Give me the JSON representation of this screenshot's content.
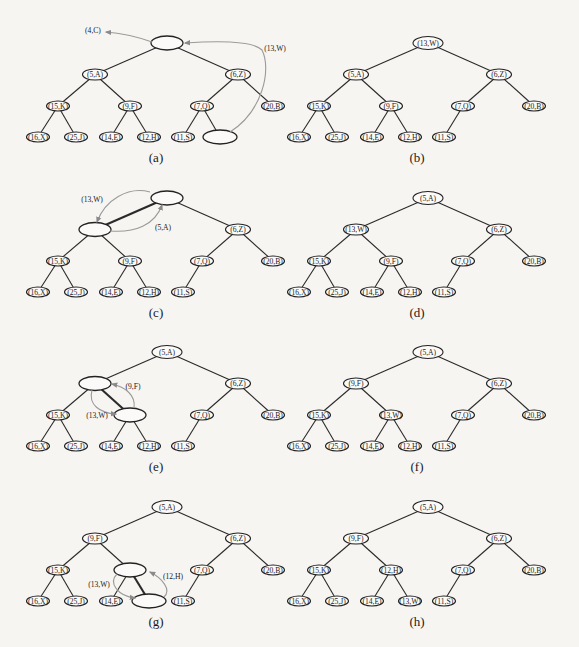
{
  "figure": {
    "background": "#f7f5f2",
    "arrow_color": "#9a9a9a",
    "panels": [
      {
        "id": "a",
        "label": "(a)",
        "col": 0,
        "row": 0,
        "nodes": {
          "root": "",
          "L": "(5,A)",
          "R": "(6,Z)",
          "LL": "(15,K)",
          "LR": "(9,F)",
          "RL": "(7,Q)",
          "RR": "(20,B)",
          "LLL": "(16,X)",
          "LLR": "(25,J)",
          "LRL": "(14,E)",
          "LRR": "(12,H)",
          "RLL": "(11,S)",
          "RLR": ""
        },
        "thick_edges": [],
        "annotations": [
          {
            "text": "(4,C)",
            "x": 93,
            "y": 30
          },
          {
            "text": "(13,W)",
            "x": 275,
            "y": 48
          }
        ],
        "arrows": [
          {
            "d": "M152,42 C135,36 120,33 106,32",
            "head": [
              106,
              32
            ]
          },
          {
            "d": "M230,132 C262,112 272,70 262,50 C252,40 215,41 185,43",
            "head": [
              185,
              43
            ]
          }
        ]
      },
      {
        "id": "b",
        "label": "(b)",
        "col": 1,
        "row": 0,
        "nodes": {
          "root": "(13,W)",
          "L": "(5,A)",
          "R": "(6,Z)",
          "LL": "(15,K)",
          "LR": "(9,F)",
          "RL": "(7,Q)",
          "RR": "(20,B)",
          "LLL": "(16,X)",
          "LLR": "(25,J)",
          "LRL": "(14,E)",
          "LRR": "(12,H)",
          "RLL": "(11,S)",
          "RLR": null
        },
        "thick_edges": [],
        "annotations": [],
        "arrows": []
      },
      {
        "id": "c",
        "label": "(c)",
        "col": 0,
        "row": 1,
        "nodes": {
          "root": "",
          "L": "",
          "R": "(6,Z)",
          "LL": "(15,K)",
          "LR": "(9,F)",
          "RL": "(7,Q)",
          "RR": "(20,B)",
          "LLL": "(16,X)",
          "LLR": "(25,J)",
          "LRL": "(14,E)",
          "LRR": "(12,H)",
          "RLL": "(11,S)",
          "RLR": null
        },
        "thick_edges": [
          "root-L"
        ],
        "annotations": [
          {
            "text": "(13,W)",
            "x": 92,
            "y": 199
          },
          {
            "text": "(5,A)",
            "x": 163,
            "y": 227
          }
        ],
        "arrows": [
          {
            "d": "M150,192 C128,186 105,200 97,222",
            "head": [
              97,
              222
            ]
          },
          {
            "d": "M110,231 C135,233 155,225 162,205",
            "head": [
              162,
              205
            ]
          }
        ]
      },
      {
        "id": "d",
        "label": "(d)",
        "col": 1,
        "row": 1,
        "nodes": {
          "root": "(5,A)",
          "L": "(13,W)",
          "R": "(6,Z)",
          "LL": "(15,K)",
          "LR": "(9,F)",
          "RL": "(7,Q)",
          "RR": "(20,B)",
          "LLL": "(16,X)",
          "LLR": "(25,J)",
          "LRL": "(14,E)",
          "LRR": "(12,H)",
          "RLL": "(11,S)",
          "RLR": null
        },
        "thick_edges": [],
        "annotations": [],
        "arrows": []
      },
      {
        "id": "e",
        "label": "(e)",
        "col": 0,
        "row": 2,
        "nodes": {
          "root": "(5,A)",
          "L": "",
          "R": "(6,Z)",
          "LL": "(15,K)",
          "LR": "",
          "RL": "(7,Q)",
          "RR": "(20,B)",
          "LLL": "(16,X)",
          "LLR": "(25,J)",
          "LRL": "(14,E)",
          "LRR": "(12,H)",
          "RLL": "(11,S)",
          "RLR": null
        },
        "thick_edges": [
          "L-LR"
        ],
        "annotations": [
          {
            "text": "(9,F)",
            "x": 133,
            "y": 386
          },
          {
            "text": "(13,W)",
            "x": 97,
            "y": 415
          }
        ],
        "arrows": [
          {
            "d": "M134,408 C136,395 125,387 112,384",
            "head": [
              112,
              384
            ]
          },
          {
            "d": "M92,390 C88,405 100,413 116,414",
            "head": [
              116,
              414
            ]
          }
        ]
      },
      {
        "id": "f",
        "label": "(f)",
        "col": 1,
        "row": 2,
        "nodes": {
          "root": "(5,A)",
          "L": "(9,F)",
          "R": "(6,Z)",
          "LL": "(15,K)",
          "LR": "(13,W)",
          "RL": "(7,Q)",
          "RR": "(20,B)",
          "LLL": "(16,X)",
          "LLR": "(25,J)",
          "LRL": "(14,E)",
          "LRR": "(12,H)",
          "RLL": "(11,S)",
          "RLR": null
        },
        "thick_edges": [],
        "annotations": [],
        "arrows": []
      },
      {
        "id": "g",
        "label": "(g)",
        "col": 0,
        "row": 3,
        "nodes": {
          "root": "(5,A)",
          "L": "(9,F)",
          "R": "(6,Z)",
          "LL": "(15,K)",
          "LR": "",
          "RL": "(7,Q)",
          "RR": "(20,B)",
          "LLL": "(16,X)",
          "LLR": "(25,J)",
          "LRL": "(14,E)",
          "LRR": "",
          "RLL": "(11,S)",
          "RLR": null
        },
        "thick_edges": [
          "LR-LRR"
        ],
        "annotations": [
          {
            "text": "(12,H)",
            "x": 173,
            "y": 576
          },
          {
            "text": "(13,W)",
            "x": 99,
            "y": 584
          }
        ],
        "arrows": [
          {
            "d": "M164,597 C172,590 162,578 150,572",
            "head": [
              150,
              572
            ]
          },
          {
            "d": "M117,574 C108,583 118,596 135,598",
            "head": [
              135,
              598
            ]
          }
        ]
      },
      {
        "id": "h",
        "label": "(h)",
        "col": 1,
        "row": 3,
        "nodes": {
          "root": "(5,A)",
          "L": "(9,F)",
          "R": "(6,Z)",
          "LL": "(15,K)",
          "LR": "(12,H)",
          "RL": "(7,Q)",
          "RR": "(20,B)",
          "LLL": "(16,X)",
          "LLR": "(25,J)",
          "LRL": "(14,E)",
          "LRR": "(13,W)",
          "RLL": "(11,S)",
          "RLR": null
        },
        "thick_edges": [],
        "annotations": [],
        "arrows": []
      }
    ]
  }
}
